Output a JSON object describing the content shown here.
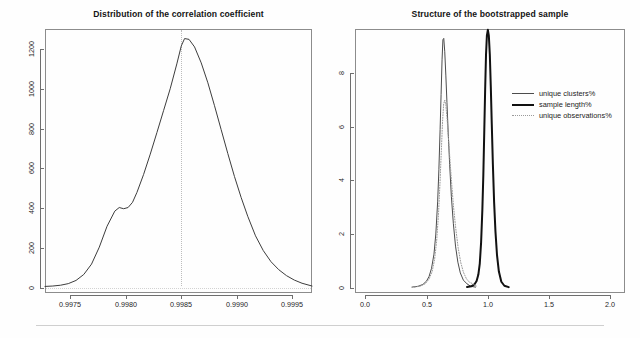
{
  "figure": {
    "width": 640,
    "height": 338,
    "background": "#fefefe",
    "footer_rule_color": "#cfcfcf"
  },
  "chart_data": [
    {
      "type": "line",
      "id": "correlation-density",
      "title": "Distribution of the correlation coefficient",
      "xlabel": "",
      "ylabel": "",
      "xlim": [
        0.99727,
        0.99968
      ],
      "ylim": [
        -25,
        1300
      ],
      "grid": false,
      "legend": "none",
      "xticks": [
        0.9975,
        0.998,
        0.9985,
        0.999,
        0.9995
      ],
      "xticklabels": [
        "0.9975",
        "0.9980",
        "0.9985",
        "0.9990",
        "0.9995"
      ],
      "yticks": [
        0,
        200,
        400,
        600,
        800,
        1000,
        1200
      ],
      "yticklabels": [
        "0",
        "200",
        "400",
        "600",
        "800",
        "1000",
        "1200"
      ],
      "annotations": [
        {
          "kind": "vertical-reference-line",
          "x": 0.9985,
          "style": "dotted",
          "color": "#bdbdbd"
        },
        {
          "kind": "horizontal-baseline",
          "y": 0,
          "style": "dotted",
          "color": "#d2d2d2"
        }
      ],
      "series": [
        {
          "name": "density",
          "style": "solid",
          "color": "#3d3d3d",
          "width": 1,
          "x": [
            0.99727,
            0.99734,
            0.99741,
            0.99748,
            0.99755,
            0.99762,
            0.99769,
            0.99776,
            0.99783,
            0.9979,
            0.99794,
            0.99798,
            0.99802,
            0.99806,
            0.9981,
            0.99816,
            0.99822,
            0.99828,
            0.99834,
            0.9984,
            0.99846,
            0.9985,
            0.99853,
            0.99857,
            0.99862,
            0.99868,
            0.99874,
            0.9988,
            0.99886,
            0.99892,
            0.99898,
            0.99904,
            0.9991,
            0.99917,
            0.99924,
            0.99931,
            0.99938,
            0.99945,
            0.99952,
            0.99959,
            0.99968
          ],
          "y": [
            8,
            10,
            14,
            22,
            38,
            68,
            120,
            205,
            310,
            386,
            404,
            398,
            404,
            430,
            480,
            570,
            672,
            780,
            890,
            1000,
            1125,
            1215,
            1252,
            1248,
            1210,
            1130,
            1030,
            915,
            795,
            675,
            560,
            455,
            360,
            262,
            188,
            132,
            92,
            62,
            40,
            24,
            10
          ]
        }
      ]
    },
    {
      "type": "line",
      "id": "bootstrap-structure",
      "title": "Structure of the bootstrapped sample",
      "xlabel": "",
      "ylabel": "",
      "xlim": [
        -0.085,
        2.12
      ],
      "ylim": [
        -0.2,
        9.65
      ],
      "grid": false,
      "legend": "inside-right",
      "xticks": [
        0.0,
        0.5,
        1.0,
        1.5,
        2.0
      ],
      "xticklabels": [
        "0.0",
        "0.5",
        "1.0",
        "1.5",
        "2.0"
      ],
      "yticks": [
        0,
        2,
        4,
        6,
        8
      ],
      "yticklabels": [
        "0",
        "2",
        "4",
        "6",
        "8"
      ],
      "annotations": [],
      "series": [
        {
          "name": "unique clusters%",
          "style": "solid",
          "color": "#4c4c4c",
          "width": 1,
          "x": [
            0.38,
            0.43,
            0.47,
            0.5,
            0.52,
            0.54,
            0.56,
            0.575,
            0.59,
            0.6,
            0.61,
            0.618,
            0.626,
            0.633,
            0.64,
            0.648,
            0.657,
            0.666,
            0.676,
            0.688,
            0.702,
            0.718,
            0.736,
            0.755,
            0.775,
            0.8,
            0.83,
            0.86,
            0.9
          ],
          "y": [
            0.02,
            0.05,
            0.12,
            0.25,
            0.42,
            0.72,
            1.25,
            2.0,
            3.2,
            4.4,
            5.9,
            7.2,
            8.5,
            9.25,
            9.3,
            8.8,
            7.9,
            6.9,
            5.8,
            4.6,
            3.4,
            2.4,
            1.55,
            0.95,
            0.55,
            0.28,
            0.14,
            0.05,
            0.02
          ]
        },
        {
          "name": "sample length%",
          "style": "solid",
          "color": "#111111",
          "width": 2,
          "x": [
            0.83,
            0.865,
            0.89,
            0.908,
            0.922,
            0.934,
            0.945,
            0.955,
            0.963,
            0.971,
            0.978,
            0.985,
            0.992,
            1.0,
            1.008,
            1.016,
            1.024,
            1.032,
            1.041,
            1.051,
            1.062,
            1.075,
            1.09,
            1.11,
            1.135,
            1.17
          ],
          "y": [
            0.02,
            0.05,
            0.12,
            0.25,
            0.48,
            0.9,
            1.7,
            2.9,
            4.2,
            5.9,
            7.4,
            8.7,
            9.4,
            9.62,
            9.4,
            8.7,
            7.5,
            6.1,
            4.6,
            3.2,
            2.1,
            1.2,
            0.6,
            0.22,
            0.07,
            0.02
          ]
        },
        {
          "name": "unique observations%",
          "style": "dotted",
          "color": "#9a9a9a",
          "width": 1,
          "x": [
            0.4,
            0.45,
            0.49,
            0.52,
            0.545,
            0.565,
            0.582,
            0.597,
            0.609,
            0.62,
            0.63,
            0.639,
            0.648,
            0.657,
            0.667,
            0.678,
            0.69,
            0.704,
            0.72,
            0.738,
            0.757,
            0.778,
            0.8,
            0.825,
            0.85,
            0.88,
            0.91
          ],
          "y": [
            0.02,
            0.06,
            0.15,
            0.32,
            0.6,
            1.05,
            1.75,
            2.75,
            3.9,
            5.1,
            6.2,
            6.85,
            7.0,
            6.8,
            6.3,
            5.6,
            4.8,
            3.9,
            3.0,
            2.2,
            1.5,
            0.95,
            0.58,
            0.33,
            0.2,
            0.14,
            0.05
          ]
        }
      ]
    }
  ],
  "left_panel": {
    "title": "Distribution of the correlation coefficient",
    "x_tick_labels": [
      "0.9975",
      "0.9980",
      "0.9985",
      "0.9990",
      "0.9995"
    ],
    "y_tick_labels": [
      "0",
      "200",
      "400",
      "600",
      "800",
      "1000",
      "1200"
    ]
  },
  "right_panel": {
    "title": "Structure of the bootstrapped sample",
    "x_tick_labels": [
      "0.0",
      "0.5",
      "1.0",
      "1.5",
      "2.0"
    ],
    "y_tick_labels": [
      "0",
      "2",
      "4",
      "6",
      "8"
    ],
    "legend": {
      "items": [
        {
          "label": "unique clusters%",
          "key": "thin-line-key"
        },
        {
          "label": "sample length%",
          "key": "thick-line-key"
        },
        {
          "label": "unique observations%",
          "key": "dotted-line-key"
        }
      ]
    }
  }
}
